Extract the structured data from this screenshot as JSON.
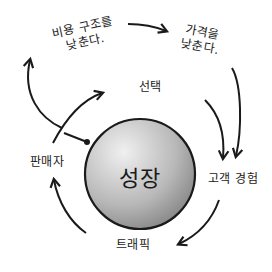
{
  "diagram": {
    "type": "flywheel",
    "center": "성장",
    "nodes": [
      {
        "id": "selection",
        "label": "선택"
      },
      {
        "id": "customer_experience",
        "label": "고객 경험"
      },
      {
        "id": "traffic",
        "label": "트래픽"
      },
      {
        "id": "sellers",
        "label": "판매자"
      },
      {
        "id": "lower_cost",
        "label_line1": "비용 구조를",
        "label_line2": "낮춘다."
      },
      {
        "id": "lower_prices",
        "label_line1": "가격을",
        "label_line2": "낮춘다."
      }
    ],
    "edges": [
      {
        "from": "selection",
        "to": "customer_experience"
      },
      {
        "from": "customer_experience",
        "to": "traffic"
      },
      {
        "from": "traffic",
        "to": "sellers"
      },
      {
        "from": "sellers",
        "to": "selection"
      },
      {
        "from": "sellers",
        "to": "lower_cost"
      },
      {
        "from": "lower_cost",
        "to": "lower_prices"
      },
      {
        "from": "lower_prices",
        "to": "customer_experience"
      }
    ],
    "colors": {
      "ink": "#1a1a1a",
      "sphere_light": "#ececec",
      "sphere_dark": "#8a8a8a"
    }
  }
}
